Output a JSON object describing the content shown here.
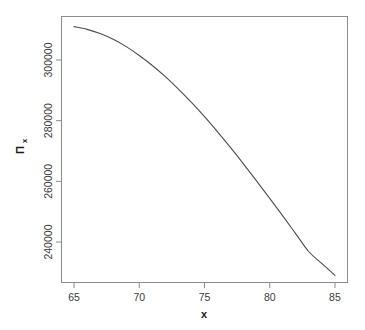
{
  "chart_data": {
    "type": "line",
    "title": "",
    "subtitle": "",
    "xlabel": "x",
    "ylabel": "Π",
    "ylabel_subscript": "x",
    "grid": false,
    "legend": null,
    "line_color": "#4d4d4d",
    "box_color": "#8c8c8c",
    "background": "#ffffff",
    "xlim": [
      64.0,
      86.0
    ],
    "ylim": [
      226500,
      314500
    ],
    "xticks": [
      65,
      70,
      75,
      80,
      85
    ],
    "xtick_labels": [
      "65",
      "70",
      "75",
      "80",
      "85"
    ],
    "yticks": [
      240000,
      260000,
      280000,
      300000
    ],
    "ytick_labels": [
      "240000",
      "260000",
      "280000",
      "300000"
    ],
    "x": [
      65,
      66,
      67,
      68,
      69,
      70,
      71,
      72,
      73,
      74,
      75,
      76,
      77,
      78,
      79,
      80,
      81,
      82,
      83,
      84,
      85
    ],
    "y": [
      311000,
      310100,
      308700,
      306800,
      304400,
      301500,
      298200,
      294500,
      290400,
      286000,
      281300,
      276300,
      271100,
      265700,
      260100,
      254400,
      248600,
      242700,
      236800,
      232900,
      229000
    ],
    "series": [
      {
        "name": "Π_x",
        "values": [
          311000,
          310100,
          308700,
          306800,
          304400,
          301500,
          298200,
          294500,
          290400,
          286000,
          281300,
          276300,
          271100,
          265700,
          260100,
          254400,
          248600,
          242700,
          236800,
          232900,
          229000
        ]
      }
    ],
    "annotations": []
  },
  "figure": {
    "plot_box": {
      "left": 61,
      "top": 16,
      "right": 348,
      "bottom": 283
    },
    "y_axis_tick_pixels": [
      216,
      160,
      105,
      49
    ],
    "x_axis_tick_pixels": [
      74,
      139,
      204,
      269,
      334
    ]
  }
}
